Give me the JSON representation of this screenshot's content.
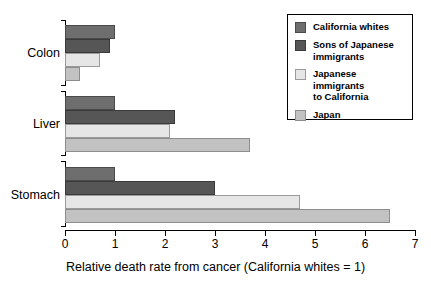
{
  "chart_data": {
    "type": "bar",
    "orientation": "horizontal",
    "title": "",
    "xlabel": "Relative death rate from cancer (California whites = 1)",
    "ylabel": "",
    "xlim": [
      0,
      7
    ],
    "xticks": [
      0,
      1,
      2,
      3,
      4,
      5,
      6,
      7
    ],
    "xticklabels": [
      "0",
      "1",
      "2",
      "3",
      "4",
      "5",
      "6",
      "7"
    ],
    "grid": false,
    "legend_position": "top-right",
    "categories": [
      "Colon",
      "Liver",
      "Stomach"
    ],
    "series": [
      {
        "name": "California whites",
        "color": "#6e6e6e",
        "values": [
          1.0,
          1.0,
          1.0
        ]
      },
      {
        "name": "Sons of Japanese immigrants",
        "color": "#565656",
        "values": [
          0.9,
          2.2,
          3.0
        ]
      },
      {
        "name": "Japanese immigrants to California",
        "color": "#e6e6e6",
        "values": [
          0.7,
          2.1,
          4.7
        ]
      },
      {
        "name": "Japan",
        "color": "#c2c2c2",
        "values": [
          0.3,
          3.7,
          6.5
        ]
      }
    ]
  },
  "legend": {
    "entries": [
      {
        "label": "California whites",
        "swatch": "legend-swatch-california-whites"
      },
      {
        "label": "Sons of Japanese\nimmigrants",
        "swatch": "legend-swatch-sons-of-japanese-immigrants"
      },
      {
        "label": "Japanese immigrants\nto California",
        "swatch": "legend-swatch-japanese-immigrants-to-california"
      },
      {
        "label": "Japan",
        "swatch": "legend-swatch-japan"
      }
    ]
  }
}
